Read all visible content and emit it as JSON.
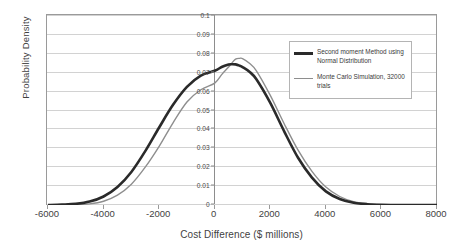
{
  "chart_data": {
    "type": "line",
    "title": "",
    "xlabel": "Cost Difference ($ millions)",
    "ylabel": "Probability Density",
    "xlim": [
      -6000,
      8000
    ],
    "ylim": [
      0,
      0.1
    ],
    "xticks": [
      "-6000",
      "-4000",
      "-2000",
      "0",
      "2000",
      "4000",
      "6000",
      "8000"
    ],
    "xtick_values": [
      -6000,
      -4000,
      -2000,
      0,
      2000,
      4000,
      6000,
      8000
    ],
    "yticks": [
      "0",
      "0.01",
      "0.02",
      "0.03",
      "0.04",
      "0.05",
      "0.06",
      "0.07",
      "0.08",
      "0.09",
      "0.1"
    ],
    "ytick_values": [
      0,
      0.01,
      0.02,
      0.03,
      0.04,
      0.05,
      0.06,
      0.07,
      0.08,
      0.09,
      0.1
    ],
    "grid": true,
    "grid_axis": "y",
    "legend_position": "upper-right",
    "x": [
      -6000,
      -5500,
      -5000,
      -4500,
      -4000,
      -3500,
      -3000,
      -2500,
      -2000,
      -1500,
      -1000,
      -500,
      0,
      250,
      500,
      600,
      750,
      900,
      1000,
      1250,
      1500,
      2000,
      2500,
      3000,
      3500,
      4000,
      4500,
      5000,
      5500,
      6000,
      6500,
      7000,
      7500,
      8000
    ],
    "series": [
      {
        "name": "Second moment Method using Normal Distribution",
        "color": "#2a2a2a",
        "linewidth": 2.6,
        "values": [
          0.0,
          0.0002,
          0.0006,
          0.0018,
          0.0045,
          0.0095,
          0.0175,
          0.0285,
          0.041,
          0.053,
          0.0625,
          0.0685,
          0.071,
          0.073,
          0.0743,
          0.0745,
          0.0744,
          0.0737,
          0.073,
          0.0705,
          0.0665,
          0.054,
          0.039,
          0.025,
          0.0145,
          0.0072,
          0.0032,
          0.0012,
          0.0004,
          0.0001,
          0.0,
          0.0,
          0.0,
          0.0
        ]
      },
      {
        "name": "Monte Carlo Simulation, 32000 trials",
        "color": "#8e8e8e",
        "linewidth": 1.4,
        "values": [
          0.0,
          0.0,
          0.0002,
          0.0006,
          0.002,
          0.0052,
          0.011,
          0.02,
          0.031,
          0.0435,
          0.0545,
          0.061,
          0.0645,
          0.069,
          0.073,
          0.0748,
          0.0772,
          0.0776,
          0.0775,
          0.075,
          0.071,
          0.058,
          0.043,
          0.029,
          0.0178,
          0.0095,
          0.0045,
          0.0018,
          0.0007,
          0.0002,
          0.0,
          0.0,
          0.0,
          0.0
        ]
      }
    ],
    "legend": [
      {
        "label": "Second moment Method using Normal Distribution",
        "color": "#2a2a2a",
        "style": "thick"
      },
      {
        "label": "Monte Carlo Simulation, 32000 trials",
        "color": "#8e8e8e",
        "style": "thin"
      }
    ]
  },
  "colors": {
    "series_dark": "#2a2a2a",
    "series_grey": "#8e8e8e",
    "gridline": "#d2d2d2",
    "frame": "#9a9a9a",
    "axis": "#8d8d8d",
    "text": "#3f3f3f",
    "background": "#ffffff"
  }
}
